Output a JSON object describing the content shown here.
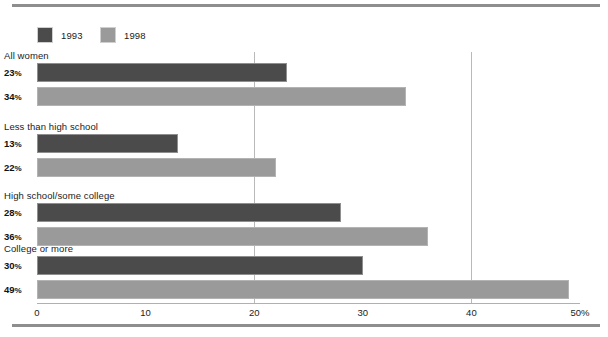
{
  "chart_data": {
    "type": "bar",
    "orientation": "horizontal",
    "title": "",
    "xlabel": "",
    "ylabel": "",
    "xlim": [
      0,
      50
    ],
    "xticks": [
      0,
      10,
      20,
      30,
      40,
      50
    ],
    "xtick_labels": [
      "0",
      "10",
      "20",
      "30",
      "40",
      "50%"
    ],
    "grid": true,
    "gridlines_at": [
      20,
      40
    ],
    "legend_position": "top-left",
    "categories": [
      "All women",
      "Less than high school",
      "High school/some college",
      "College or more"
    ],
    "series": [
      {
        "name": "1993",
        "color": "#4b4b4b",
        "values": [
          23,
          13,
          28,
          30
        ],
        "value_labels": [
          "23%",
          "13%",
          "28%",
          "30%"
        ]
      },
      {
        "name": "1998",
        "color": "#9a9a9a",
        "values": [
          34,
          22,
          36,
          49
        ],
        "value_labels": [
          "34%",
          "22%",
          "36%",
          "49%"
        ]
      }
    ]
  },
  "legend": {
    "items": [
      {
        "label": "1993",
        "color": "#4b4b4b"
      },
      {
        "label": "1998",
        "color": "#9a9a9a"
      }
    ]
  },
  "colors": {
    "series_1993": "#4b4b4b",
    "series_1998": "#9a9a9a",
    "rule": "#8e8e8e",
    "gridline": "#b9b9b9",
    "axis": "#b0b0b0",
    "text": "#1b1b1b",
    "background": "#ffffff"
  }
}
